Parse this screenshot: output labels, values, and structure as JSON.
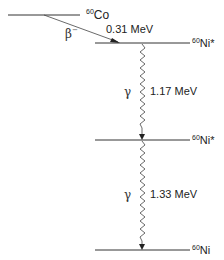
{
  "diagram": {
    "type": "nuclear decay scheme",
    "levels": [
      {
        "id": "co60",
        "mass": "60",
        "symbol": "Co",
        "y": 15,
        "x1": 8,
        "x2": 80
      },
      {
        "id": "ni60_excited_2",
        "mass": "60",
        "symbol": "Ni*",
        "y": 43,
        "x1": 95,
        "x2": 190
      },
      {
        "id": "ni60_excited_1",
        "mass": "60",
        "symbol": "Ni*",
        "y": 140,
        "x1": 95,
        "x2": 190
      },
      {
        "id": "ni60_ground",
        "mass": "60",
        "symbol": "Ni",
        "y": 250,
        "x1": 95,
        "x2": 190
      }
    ],
    "transitions": [
      {
        "id": "beta",
        "type": "β⁻",
        "label": "β",
        "label_sup": "−",
        "energy": "0.31 MeV"
      },
      {
        "id": "gamma1",
        "type": "γ",
        "label": "γ",
        "energy": "1.17 MeV"
      },
      {
        "id": "gamma2",
        "type": "γ",
        "label": "γ",
        "energy": "1.33 MeV"
      }
    ],
    "colors": {
      "line": "#333333",
      "text": "#222222"
    }
  }
}
